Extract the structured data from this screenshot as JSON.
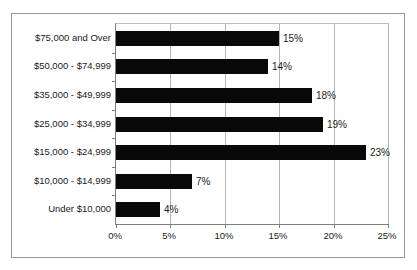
{
  "chart_data": {
    "type": "bar",
    "orientation": "horizontal",
    "title": "",
    "xlabel": "",
    "ylabel": "",
    "xlim": [
      0,
      25
    ],
    "grid": true,
    "legend": null,
    "xtick_labels": [
      "0%",
      "5%",
      "10%",
      "15%",
      "20%",
      "25%"
    ],
    "xtick_values": [
      0,
      5,
      10,
      15,
      20,
      25
    ],
    "categories": [
      "Under $10,000",
      "$10,000 - $14,999",
      "$15,000 - $24,999",
      "$25,000 - $34,999",
      "$35,000 - $49,999",
      "$50,000 - $74,999",
      "$75,000 and Over"
    ],
    "values": [
      4,
      7,
      23,
      19,
      18,
      14,
      15
    ],
    "data_labels": [
      "4%",
      "7%",
      "23%",
      "19%",
      "18%",
      "14%",
      "15%"
    ],
    "bar_color": "#090909",
    "grid_color": "#b5b5b5",
    "axis_color": "#7d7d7d",
    "frame_color": "#9a9a9a",
    "background_color": "#ffffff"
  }
}
